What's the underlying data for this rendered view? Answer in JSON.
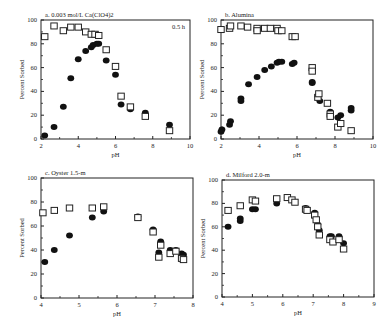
{
  "chart_data": [
    {
      "id": "a",
      "type": "scatter",
      "title": "a. 0.003 mol/L Ca(ClO4)2",
      "annotation": "0.5 h",
      "xlabel": "pH",
      "ylabel": "Percent Sorbed",
      "xlim": [
        2,
        10
      ],
      "ylim": [
        0,
        100
      ],
      "xticks": [
        2,
        4,
        6,
        8,
        10
      ],
      "yticks": [
        0,
        20,
        40,
        60,
        80,
        100
      ],
      "grid": false,
      "series": [
        {
          "name": "filled circles",
          "marker": "filled-circle",
          "x": [
            2.2,
            2.7,
            3.2,
            3.6,
            4.0,
            4.4,
            4.7,
            4.8,
            5.0,
            5.1,
            5.5,
            6.0,
            6.3,
            6.8,
            7.6,
            8.9
          ],
          "y": [
            3,
            10,
            27,
            51,
            67,
            74,
            77,
            79,
            80,
            80,
            66,
            54,
            29,
            25,
            22,
            12
          ]
        },
        {
          "name": "open squares",
          "marker": "open-square",
          "x": [
            2.2,
            2.7,
            3.2,
            3.6,
            4.0,
            4.4,
            4.7,
            4.9,
            5.1,
            5.5,
            6.0,
            6.3,
            6.8,
            7.6,
            8.9
          ],
          "y": [
            86,
            95,
            91,
            94,
            94,
            90,
            88,
            88,
            87,
            75,
            61,
            36,
            27,
            19,
            7
          ]
        }
      ]
    },
    {
      "id": "b",
      "type": "scatter",
      "title": "b. Alumina",
      "xlabel": "pH",
      "ylabel": "Percent Sorbed",
      "xlim": [
        2,
        10
      ],
      "ylim": [
        0,
        100
      ],
      "xticks": [
        2,
        4,
        6,
        8,
        10
      ],
      "yticks": [
        0,
        20,
        40,
        60,
        80,
        100
      ],
      "grid": false,
      "series": [
        {
          "name": "filled circles",
          "marker": "filled-circle",
          "x": [
            2.0,
            2.05,
            2.45,
            2.5,
            3.05,
            3.05,
            3.45,
            3.9,
            4.3,
            4.65,
            4.95,
            5.05,
            5.2,
            5.75,
            5.85,
            6.8,
            6.8,
            7.1,
            7.2,
            7.75,
            8.15,
            8.3,
            8.85,
            8.85
          ],
          "y": [
            6,
            8,
            12,
            15,
            32,
            34,
            46,
            52,
            58,
            61,
            64,
            65,
            65,
            63,
            64,
            47,
            48,
            36,
            32,
            23,
            18,
            20,
            24,
            26
          ]
        },
        {
          "name": "open squares",
          "marker": "open-square",
          "x": [
            2.0,
            2.45,
            2.5,
            3.05,
            3.4,
            3.9,
            3.9,
            4.3,
            4.6,
            4.95,
            5.0,
            5.2,
            5.75,
            5.9,
            6.8,
            6.8,
            7.1,
            7.15,
            7.6,
            7.75,
            7.75,
            8.15,
            8.3,
            8.85
          ],
          "y": [
            92,
            93,
            95,
            95,
            94,
            93,
            91,
            93,
            93,
            93,
            91,
            91,
            86,
            86,
            60,
            57,
            35,
            38,
            30,
            21,
            19,
            10,
            13,
            7
          ]
        }
      ]
    },
    {
      "id": "c",
      "type": "scatter",
      "title": "c. Oyster 1.5-m",
      "xlabel": "pH",
      "ylabel": "Percent Sorbed",
      "xlim": [
        4,
        8
      ],
      "ylim": [
        0,
        100
      ],
      "xticks": [
        4,
        5,
        6,
        7,
        8
      ],
      "yticks": [
        0,
        20,
        40,
        60,
        80,
        100
      ],
      "grid": false,
      "series": [
        {
          "name": "filled circles",
          "marker": "filled-circle",
          "x": [
            4.1,
            4.35,
            4.75,
            5.35,
            5.65,
            6.55,
            6.95,
            7.1,
            7.15,
            7.4,
            7.55,
            7.7,
            7.75
          ],
          "y": [
            30,
            40,
            52,
            67,
            72,
            68,
            57,
            38,
            47,
            40,
            40,
            37,
            36
          ]
        },
        {
          "name": "open squares",
          "marker": "open-square",
          "x": [
            4.05,
            4.35,
            4.75,
            5.35,
            5.65,
            6.55,
            6.95,
            7.1,
            7.15,
            7.4,
            7.55,
            7.7,
            7.75
          ],
          "y": [
            71,
            73,
            75,
            75,
            76,
            67,
            55,
            34,
            44,
            37,
            39,
            33,
            32
          ]
        }
      ]
    },
    {
      "id": "d",
      "type": "scatter",
      "title": "d. Milford 2.0-m",
      "xlabel": "pH",
      "ylabel": "Percent Sorbed",
      "xlim": [
        4,
        9
      ],
      "ylim": [
        0,
        100
      ],
      "xticks": [
        4,
        5,
        6,
        7,
        8,
        9
      ],
      "yticks": [
        0,
        20,
        40,
        60,
        80,
        100
      ],
      "grid": false,
      "series": [
        {
          "name": "filled circles",
          "marker": "filled-circle",
          "x": [
            4.2,
            4.6,
            4.6,
            5.0,
            5.1,
            5.8,
            6.15,
            6.75,
            7.05,
            7.15,
            7.2,
            7.55,
            7.6,
            7.85,
            8.0
          ],
          "y": [
            60,
            65,
            67,
            75,
            75,
            80,
            85,
            76,
            72,
            62,
            57,
            52,
            52,
            52,
            46
          ]
        },
        {
          "name": "open squares",
          "marker": "open-square",
          "x": [
            4.2,
            4.6,
            5.0,
            5.1,
            5.8,
            6.15,
            6.3,
            6.4,
            6.75,
            6.8,
            7.05,
            7.1,
            7.15,
            7.2,
            7.55,
            7.65,
            7.85,
            8.0
          ],
          "y": [
            74,
            78,
            83,
            82,
            84,
            85,
            83,
            81,
            75,
            74,
            70,
            66,
            60,
            53,
            49,
            47,
            49,
            41
          ]
        }
      ]
    }
  ]
}
